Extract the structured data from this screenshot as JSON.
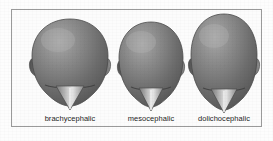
{
  "figure": {
    "kind": "anatomy-illustration",
    "caption_row_present": true,
    "border_color": "#9a9a9a",
    "background_color": "#fcfcfc",
    "page_background_color": "#fdfdfd",
    "label_text_color": "#1d1d1d",
    "skull_fill_dark": "#5d5d5d",
    "skull_fill_light": "#cfcfcf",
    "skull_outline": "#4a4a4a",
    "items": [
      {
        "label": "brachycephalic",
        "description": "wide short skull viewed from front",
        "width_px": 62,
        "height_px": 82,
        "top_px": 17,
        "center_x_px": 61,
        "ratio_label": "wide"
      },
      {
        "label": "mesocephalic",
        "description": "medium proportioned skull viewed from front",
        "width_px": 52,
        "height_px": 80,
        "top_px": 20,
        "center_x_px": 137,
        "ratio_label": "medium"
      },
      {
        "label": "dolichocephalic",
        "description": "narrow long skull viewed from front",
        "width_px": 55,
        "height_px": 88,
        "top_px": 15,
        "center_x_px": 213,
        "ratio_label": "long"
      }
    ]
  }
}
